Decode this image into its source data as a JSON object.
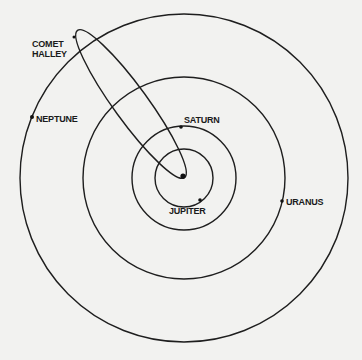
{
  "diagram": {
    "center": {
      "x": 184,
      "y": 178
    },
    "colors": {
      "background": "#f2f2f0",
      "line": "#1e1e1e",
      "text": "#1a1a1a"
    },
    "orbits": [
      {
        "name": "Jupiter",
        "radius": 29
      },
      {
        "name": "Saturn",
        "radius": 52
      },
      {
        "name": "Uranus",
        "radius": 102
      },
      {
        "name": "Neptune",
        "radius": 164
      }
    ],
    "labels": {
      "comet_line1": "COMET",
      "comet_line2": "HALLEY",
      "neptune": "NEPTUNE",
      "saturn": "SATURN",
      "jupiter": "JUPITER",
      "uranus": "URANUS"
    }
  }
}
